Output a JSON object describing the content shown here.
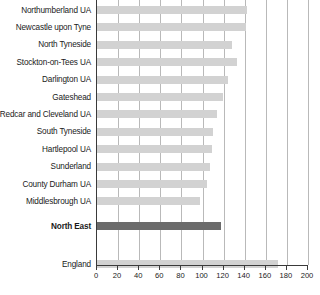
{
  "chart_data": {
    "type": "bar",
    "orientation": "horizontal",
    "title": "",
    "xlabel": "",
    "ylabel": "",
    "xlim": [
      0,
      200
    ],
    "xticks": [
      0,
      20,
      40,
      60,
      80,
      100,
      120,
      140,
      160,
      180,
      200
    ],
    "grid": true,
    "legend": "none",
    "categories": [
      "Northumberland UA",
      "Newcastle upon Tyne",
      "North Tyneside",
      "Stockton-on-Tees UA",
      "Darlington UA",
      "Gateshead",
      "Redcar and Cleveland UA",
      "South Tyneside",
      "Hartlepool UA",
      "Sunderland",
      "County Durham UA",
      "Middlesbrough UA",
      "North East",
      "England"
    ],
    "values": [
      142,
      141,
      128,
      133,
      124,
      119,
      114,
      110,
      109,
      107,
      104,
      98,
      118,
      172
    ],
    "highlight_category": "North East",
    "colors": {
      "bar": "#d2d2d2",
      "bar_highlight": "#6b6b6b",
      "gridline": "#b9b9b9",
      "axis": "#3a3a3a",
      "text": "#1a1a1a",
      "background": "#ffffff"
    }
  }
}
